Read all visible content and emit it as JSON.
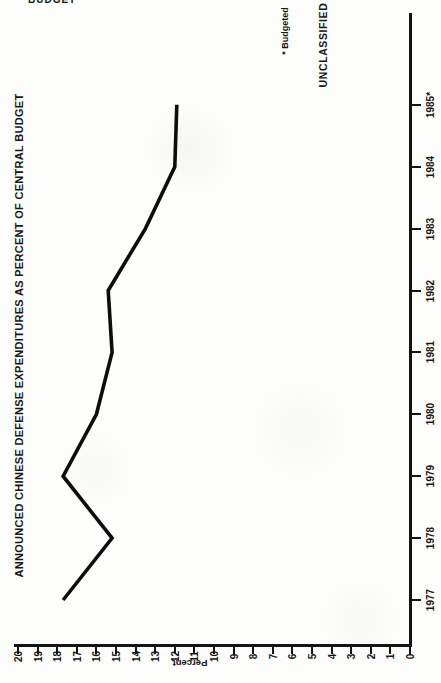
{
  "page": {
    "header_fragment": "BUDGET"
  },
  "chart_data": {
    "type": "line",
    "title": "ANNOUNCED CHINESE DEFENSE EXPENDITURES AS PERCENT OF CENTRAL BUDGET",
    "orientation": "page rotated 90 degrees: year axis runs vertically on the right, percent axis runs horizontally along the bottom (20 at left, 0 at right)",
    "categories": [
      "1977",
      "1978",
      "1979",
      "1980",
      "1981",
      "1982",
      "1983",
      "1984",
      "1985*"
    ],
    "values": [
      17.7,
      15.2,
      17.7,
      16.0,
      15.2,
      15.4,
      13.5,
      12.0,
      11.9
    ],
    "series_name": "Announced Chinese defense expenditures as percent of central budget",
    "value_axis": {
      "label": "Percent",
      "min": 0,
      "max": 20,
      "step": 1,
      "ticks_left_to_right": [
        20,
        19,
        18,
        17,
        16,
        15,
        14,
        13,
        12,
        11,
        10,
        9,
        8,
        7,
        6,
        5,
        4,
        3,
        2,
        1,
        0
      ]
    },
    "footnote": "* Budgeted",
    "classification": "UNCLASSIFIED",
    "line_color": "#0d0d0d",
    "axis_color": "#141414",
    "grid": false,
    "legend": false
  }
}
